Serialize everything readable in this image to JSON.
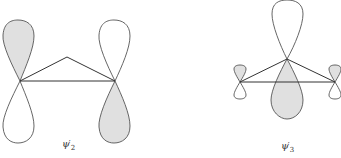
{
  "figure": {
    "diagrams": [
      {
        "id": "psi2",
        "label": "ψ",
        "prime": "′",
        "subscript": "2",
        "description": "Three-atom triangle with p orbitals on the two basal atoms; left atom upper lobe shaded, right atom lower lobe shaded"
      },
      {
        "id": "psi3",
        "label": "ψ",
        "prime": "′",
        "subscript": "3",
        "description": "Three-atom triangle with large p orbital on apex atom (lower lobe shaded) and small p orbitals on basal atoms (upper lobes shaded)"
      }
    ],
    "colors": {
      "shaded_lobe": "#e0e0e0",
      "unshaded_lobe": "#ffffff",
      "outline": "#555555",
      "bond": "#333333"
    }
  }
}
